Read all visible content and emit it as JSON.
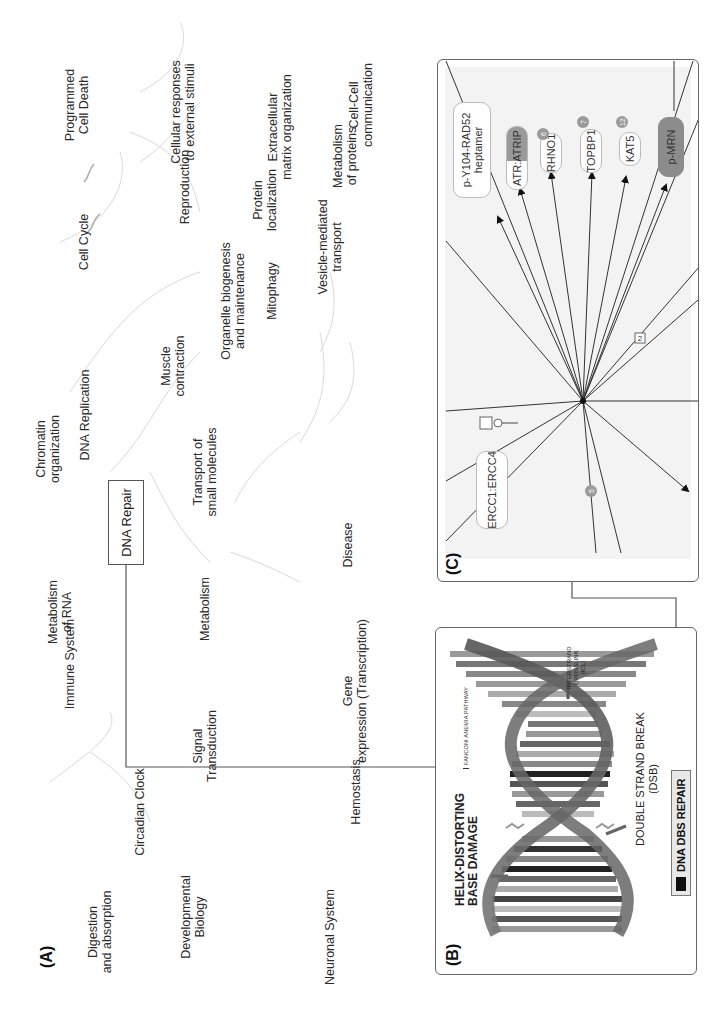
{
  "panel_a": {
    "letter": "(A)",
    "hub_label": "DNA Repair",
    "pathways": [
      {
        "label": "Digestion\nand absorption",
        "x": 125,
        "y": 100
      },
      {
        "label": "Immune System",
        "x": 398,
        "y": 70
      },
      {
        "label": "Metabolism\nof RNA",
        "x": 603,
        "y": 60
      },
      {
        "label": "Chromatin\norganization",
        "x": 755,
        "y": 48
      },
      {
        "label": "DNA Replication",
        "x": 918,
        "y": 85
      },
      {
        "label": "Cell Cycle",
        "x": 1102,
        "y": 84
      },
      {
        "label": "Programmed\nCell Death",
        "x": 1308,
        "y": 77
      },
      {
        "label": "Circadian Clock",
        "x": 820,
        "y": 138
      },
      {
        "label": "Developmental\nBiology",
        "x": 140,
        "y": 190
      },
      {
        "label": "Signal\nTransduction",
        "x": 665,
        "y": 205
      },
      {
        "label": "Metabolism",
        "x": 520,
        "y": 205
      },
      {
        "label": "Transport of\nsmall molecules",
        "x": 0,
        "y": 0
      },
      {
        "label": "Muscle\ncontraction",
        "x": 0,
        "y": 0
      },
      {
        "label": "Organelle biogenesis\nand maintenance",
        "x": 0,
        "y": 0
      },
      {
        "label": "Reproduction",
        "x": 0,
        "y": 0
      },
      {
        "label": "Cellular responses\nto external stimuli",
        "x": 0,
        "y": 0
      },
      {
        "label": "Protein\nlocalization",
        "x": 0,
        "y": 0
      },
      {
        "label": "Mitophagy",
        "x": 0,
        "y": 0
      },
      {
        "label": "Extracellular\nmatrix organization",
        "x": 0,
        "y": 0
      },
      {
        "label": "Neuronal System",
        "x": 0,
        "y": 0
      },
      {
        "label": "Hemostasis",
        "x": 0,
        "y": 0
      },
      {
        "label": "Gene\nexpression (Transcription)",
        "x": 0,
        "y": 0
      },
      {
        "label": "Disease",
        "x": 0,
        "y": 0
      },
      {
        "label": "Metabolism\nof proteins",
        "x": 0,
        "y": 0
      },
      {
        "label": "Vesicle-mediated\ntransport",
        "x": 0,
        "y": 0
      },
      {
        "label": "Cell-Cell\ncommunication",
        "x": 0,
        "y": 0
      }
    ]
  },
  "panel_b": {
    "letter": "(B)",
    "helix_label": "HELIX-DISTORTING\nBASE DAMAGE",
    "dsb_label": "DOUBLE STRAND BREAK\n(DSB)",
    "icl_label": "INTERSTRAND\nCROSSLINK\n(ICL)",
    "fanconi_label": "FANCONI ANEMIA PATHWAY",
    "legend_label": "DNA DBS REPAIR"
  },
  "panel_c": {
    "letter": "(C)",
    "nodes": [
      {
        "id": "rad52",
        "label": "p-Y104-RAD52\nheptamer",
        "style": "light"
      },
      {
        "id": "atr",
        "label": "ATR:ATRIP",
        "style": "half"
      },
      {
        "id": "rhno1",
        "label": "RHNO1",
        "style": "light",
        "badge": "6"
      },
      {
        "id": "topbp1",
        "label": "TOPBP1",
        "style": "light",
        "badge": "7"
      },
      {
        "id": "kat5",
        "label": "KAT5",
        "style": "light",
        "badge": "12"
      },
      {
        "id": "mrn",
        "label": "p-MRN",
        "style": "dark"
      },
      {
        "id": "ercc",
        "label": "ERCC1:ERCC4",
        "style": "light"
      }
    ],
    "edge_label": "2",
    "bottom_badge": "5"
  }
}
